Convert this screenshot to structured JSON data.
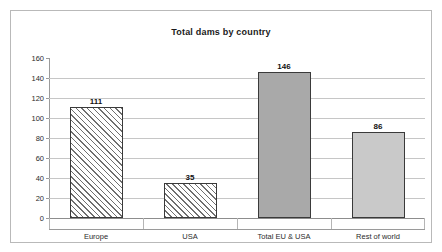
{
  "chart_data": {
    "type": "bar",
    "title": "Total dams by country",
    "xlabel": "",
    "ylabel": "",
    "categories": [
      "Europe",
      "USA",
      "Total EU & USA",
      "Rest of world"
    ],
    "values": [
      111,
      35,
      146,
      86
    ],
    "data_labels": [
      "111",
      "35",
      "146",
      "86"
    ],
    "series": [
      {
        "name": "Total dams",
        "values": [
          111,
          35,
          146,
          86
        ]
      }
    ],
    "ylim": [
      0,
      160
    ],
    "ytick_step": 20,
    "ytick_labels": [
      "0",
      "20",
      "40",
      "60",
      "80",
      "100",
      "120",
      "140",
      "160"
    ],
    "ytick_values": [
      0,
      20,
      40,
      60,
      80,
      100,
      120,
      140,
      160
    ],
    "grid": true,
    "grid_axis": "y",
    "legend": false,
    "legend_position": "none",
    "bar_styles": [
      "hatched",
      "hatched",
      "solid-dark",
      "solid-light"
    ],
    "colors": {
      "hatch_line": "#6f6f6f",
      "hatch_background": "#ffffff",
      "solid_dark": "#a9a9a9",
      "solid_light": "#c9c9c9",
      "bar_outline": "#3a3a3a",
      "gridline": "#c6c6c6",
      "axis_line": "#9a9a9a",
      "frame_border": "#b9b9b9",
      "text": "#2b2b2b",
      "plot_background": "#ffffff"
    }
  }
}
